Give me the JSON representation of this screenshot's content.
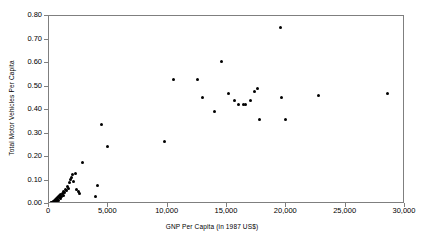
{
  "chart_data": {
    "type": "scatter",
    "title": "",
    "xlabel": "GNP Per Capita (in 1987 US$)",
    "ylabel": "Total Motor Vehicles Per Capita",
    "xlim": [
      0,
      30000
    ],
    "ylim": [
      0.0,
      0.8
    ],
    "xticks": [
      0,
      5000,
      10000,
      15000,
      20000,
      25000,
      30000
    ],
    "xtick_labels": [
      "0",
      "5,000",
      "10,000",
      "15,000",
      "20,000",
      "25,000",
      "30,000"
    ],
    "yticks": [
      0.0,
      0.1,
      0.2,
      0.3,
      0.4,
      0.5,
      0.6,
      0.7,
      0.8
    ],
    "ytick_labels": [
      "0.00",
      "0.10",
      "0.20",
      "0.30",
      "0.40",
      "0.50",
      "0.60",
      "0.70",
      "0.80"
    ],
    "grid": false,
    "legend": null,
    "marker_color": "#000000",
    "frame_color": "#7f7f7f",
    "series": [
      {
        "name": "Countries",
        "points": [
          [
            120,
            0.004
          ],
          [
            180,
            0.006
          ],
          [
            240,
            0.008
          ],
          [
            300,
            0.005
          ],
          [
            340,
            0.01
          ],
          [
            380,
            0.012
          ],
          [
            420,
            0.007
          ],
          [
            460,
            0.015
          ],
          [
            500,
            0.011
          ],
          [
            540,
            0.018
          ],
          [
            580,
            0.014
          ],
          [
            620,
            0.022
          ],
          [
            660,
            0.009
          ],
          [
            700,
            0.026
          ],
          [
            740,
            0.02
          ],
          [
            780,
            0.03
          ],
          [
            820,
            0.016
          ],
          [
            860,
            0.035
          ],
          [
            900,
            0.028
          ],
          [
            950,
            0.024
          ],
          [
            1000,
            0.04
          ],
          [
            1060,
            0.032
          ],
          [
            1120,
            0.045
          ],
          [
            1180,
            0.038
          ],
          [
            1250,
            0.055
          ],
          [
            1320,
            0.048
          ],
          [
            1400,
            0.062
          ],
          [
            1480,
            0.058
          ],
          [
            1560,
            0.075
          ],
          [
            1640,
            0.068
          ],
          [
            1720,
            0.09
          ],
          [
            1800,
            0.105
          ],
          [
            1900,
            0.112
          ],
          [
            2000,
            0.125
          ],
          [
            2100,
            0.096
          ],
          [
            2200,
            0.128
          ],
          [
            2300,
            0.06
          ],
          [
            2450,
            0.052
          ],
          [
            2600,
            0.045
          ],
          [
            2800,
            0.178
          ],
          [
            3950,
            0.032
          ],
          [
            4050,
            0.078
          ],
          [
            4400,
            0.34
          ],
          [
            4950,
            0.245
          ],
          [
            9750,
            0.265
          ],
          [
            10450,
            0.53
          ],
          [
            12550,
            0.53
          ],
          [
            12950,
            0.455
          ],
          [
            13950,
            0.395
          ],
          [
            14500,
            0.605
          ],
          [
            15100,
            0.47
          ],
          [
            15650,
            0.44
          ],
          [
            15950,
            0.425
          ],
          [
            16400,
            0.425
          ],
          [
            16550,
            0.425
          ],
          [
            16950,
            0.44
          ],
          [
            17350,
            0.48
          ],
          [
            17550,
            0.49
          ],
          [
            17700,
            0.36
          ],
          [
            19550,
            0.75
          ],
          [
            19600,
            0.455
          ],
          [
            19950,
            0.36
          ],
          [
            22750,
            0.46
          ],
          [
            28550,
            0.47
          ]
        ]
      }
    ]
  },
  "axes": {
    "x_title": "GNP Per Capita (in 1987 US$)",
    "y_title": "Total Motor Vehicles Per Capita"
  }
}
